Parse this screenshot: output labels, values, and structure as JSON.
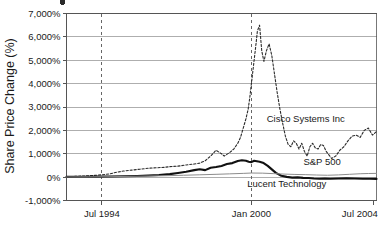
{
  "chart_data": {
    "type": "line",
    "title": "",
    "xlabel": "",
    "ylabel": "Share Price Change (%)",
    "ylim": [
      -1000,
      7000
    ],
    "grid": true,
    "legend_position": "inline-right-annotations",
    "y_ticks": [
      {
        "value": 7000,
        "label": "7,000%"
      },
      {
        "value": 6000,
        "label": "6,000%"
      },
      {
        "value": 5000,
        "label": "5,000%"
      },
      {
        "value": 4000,
        "label": "4,000%"
      },
      {
        "value": 3000,
        "label": "3,000%"
      },
      {
        "value": 2000,
        "label": "2,000%"
      },
      {
        "value": 1000,
        "label": "1,000%"
      },
      {
        "value": 0,
        "label": "0%"
      },
      {
        "value": -1000,
        "label": "-1,000%"
      }
    ],
    "x_ticks": [
      {
        "value": 1994.5,
        "label": "Jul 1994"
      },
      {
        "value": 2000.0,
        "label": "Jan 2000"
      },
      {
        "value": 2004.5,
        "label": "Jul 2004"
      }
    ],
    "xlim": [
      1993.2,
      2004.6
    ],
    "reference_lines": [
      {
        "value": 1994.5,
        "style": "dashed"
      },
      {
        "value": 2000.0,
        "style": "dashed"
      }
    ],
    "series": [
      {
        "name": "Cisco Systems Inc",
        "style": "dashed",
        "color": "#2b2b2b",
        "label_x": 2002.0,
        "label_y": 2350,
        "x": [
          1993.2,
          1993.5,
          1993.8,
          1994.0,
          1994.3,
          1994.5,
          1994.8,
          1995.0,
          1995.3,
          1995.6,
          1995.9,
          1996.2,
          1996.5,
          1996.8,
          1997.0,
          1997.3,
          1997.6,
          1997.9,
          1998.1,
          1998.3,
          1998.5,
          1998.7,
          1998.9,
          1999.0,
          1999.2,
          1999.35,
          1999.5,
          1999.6,
          1999.7,
          1999.8,
          1999.88,
          1999.94,
          2000.0,
          2000.05,
          2000.1,
          2000.16,
          2000.22,
          2000.3,
          2000.38,
          2000.46,
          2000.55,
          2000.65,
          2000.75,
          2000.85,
          2000.95,
          2001.05,
          2001.15,
          2001.25,
          2001.35,
          2001.45,
          2001.55,
          2001.65,
          2001.75,
          2001.85,
          2001.95,
          2002.05,
          2002.15,
          2002.25,
          2002.35,
          2002.45,
          2002.55,
          2002.65,
          2002.75,
          2002.85,
          2002.95,
          2003.1,
          2003.25,
          2003.4,
          2003.55,
          2003.7,
          2003.85,
          2004.0,
          2004.15,
          2004.3,
          2004.45,
          2004.6
        ],
        "y": [
          20,
          30,
          45,
          60,
          80,
          100,
          140,
          200,
          260,
          300,
          340,
          380,
          400,
          420,
          450,
          470,
          520,
          560,
          600,
          700,
          900,
          1150,
          1000,
          900,
          1050,
          1200,
          1450,
          1700,
          2100,
          2500,
          2900,
          3400,
          4000,
          4500,
          5000,
          5600,
          6250,
          6500,
          5400,
          4950,
          5400,
          5700,
          5200,
          4400,
          3600,
          2900,
          2300,
          1750,
          1400,
          1300,
          1550,
          1450,
          1200,
          1450,
          1100,
          900,
          1300,
          1450,
          1250,
          1200,
          1400,
          1350,
          1100,
          950,
          800,
          900,
          1150,
          1300,
          1550,
          1750,
          1800,
          1700,
          2000,
          2100,
          1800,
          1950
        ]
      },
      {
        "name": "Lucent Technology",
        "style": "solid-thick",
        "color": "#111111",
        "label_x": 2001.3,
        "label_y": -420,
        "x": [
          1993.2,
          1993.8,
          1994.3,
          1994.8,
          1995.3,
          1995.8,
          1996.2,
          1996.6,
          1997.0,
          1997.3,
          1997.6,
          1997.9,
          1998.1,
          1998.3,
          1998.5,
          1998.7,
          1998.9,
          1999.1,
          1999.3,
          1999.5,
          1999.65,
          1999.8,
          1999.9,
          2000.0,
          2000.1,
          2000.2,
          2000.3,
          2000.45,
          2000.6,
          2000.75,
          2000.9,
          2001.1,
          2001.3,
          2001.5,
          2001.7,
          2001.9,
          2002.1,
          2002.3,
          2002.5,
          2002.7,
          2002.9,
          2003.2,
          2003.5,
          2003.8,
          2004.1,
          2004.35,
          2004.6
        ],
        "y": [
          10,
          15,
          20,
          25,
          35,
          50,
          70,
          90,
          130,
          180,
          230,
          300,
          340,
          300,
          400,
          430,
          480,
          560,
          600,
          690,
          720,
          700,
          660,
          640,
          700,
          680,
          660,
          600,
          480,
          330,
          180,
          60,
          10,
          -20,
          -10,
          -30,
          -40,
          -60,
          -70,
          -60,
          -70,
          -60,
          -55,
          -60,
          -70,
          -70,
          -75
        ]
      },
      {
        "name": "S&P 500",
        "style": "solid-thin",
        "color": "#8c8c8c",
        "label_x": 2002.6,
        "label_y": 520,
        "x": [
          1993.2,
          1994.0,
          1994.8,
          1995.5,
          1996.2,
          1996.9,
          1997.5,
          1998.1,
          1998.7,
          1999.2,
          1999.7,
          2000.0,
          2000.4,
          2000.8,
          2001.2,
          2001.6,
          2002.0,
          2002.4,
          2002.8,
          2003.2,
          2003.6,
          2004.0,
          2004.3,
          2004.6
        ],
        "y": [
          5,
          12,
          20,
          32,
          48,
          62,
          80,
          100,
          120,
          140,
          160,
          175,
          170,
          150,
          130,
          115,
          105,
          90,
          80,
          95,
          120,
          145,
          155,
          160
        ]
      }
    ]
  },
  "axis": {
    "y_title": "Share Price Change (%)"
  }
}
